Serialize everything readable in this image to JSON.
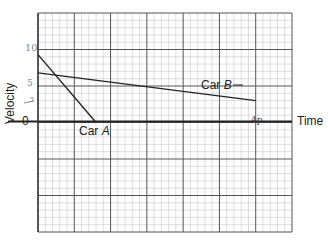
{
  "chart_data": {
    "type": "line",
    "title": "",
    "xlabel": "Time",
    "ylabel": "Velocity",
    "grid": true,
    "grid_major_spacing_px": 36.3,
    "grid_minor_per_major": 5,
    "ylim_grid_units": [
      -3,
      3
    ],
    "xlim_grid_units": [
      0,
      7
    ],
    "y_tick_labels": [
      {
        "label": "10",
        "grid_value": 10
      },
      {
        "label": "5",
        "grid_value": 5
      },
      {
        "label": "3",
        "grid_value": 3
      },
      {
        "label": "0",
        "grid_value": 0
      }
    ],
    "x_annotation": {
      "label": "4p",
      "note": "handwritten mark at x≈6 major units on time axis"
    },
    "series": [
      {
        "name": "Car A",
        "label": "Car A",
        "points": [
          {
            "x": 0,
            "y": 9.3
          },
          {
            "x": 1.6,
            "y": 0
          }
        ]
      },
      {
        "name": "Car B",
        "label": "Car B",
        "points": [
          {
            "x": 0,
            "y": 6.8
          },
          {
            "x": 6,
            "y": 3
          }
        ]
      }
    ],
    "annotations": [
      "Car A",
      "Car B"
    ]
  },
  "labels": {
    "ylabel": "Velocity",
    "xlabel": "Time",
    "zero": "0",
    "ten": "10",
    "five": "5",
    "three": "3",
    "carA_prefix": "Car ",
    "carA_letter": "A",
    "carB_prefix": "Car ",
    "carB_letter": "B",
    "mark": "4p"
  },
  "colors": {
    "grid_minor": "#c8c8c8",
    "grid_major": "#555555",
    "axis": "#222222",
    "line": "#222222"
  }
}
